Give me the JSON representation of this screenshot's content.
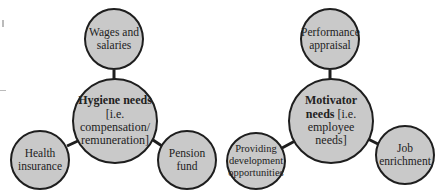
{
  "diagrams": [
    {
      "name": "hygiene",
      "hub": {
        "title": "Hygiene needs",
        "subtitle": "[i.e. compensation/ remuneration]"
      },
      "satellites": [
        {
          "label": "Wages and salaries"
        },
        {
          "label": "Health insurance"
        },
        {
          "label": "Pension fund"
        }
      ]
    },
    {
      "name": "motivator",
      "hub": {
        "title": "Motivator needs",
        "subtitle": "[i.e. employee needs]"
      },
      "satellites": [
        {
          "label": "Performance appraisal"
        },
        {
          "label": "Providing development opportunities"
        },
        {
          "label": "Job enrichment"
        }
      ]
    }
  ],
  "colors": {
    "node_fill": "#c9c9c9",
    "stroke": "#1e1e1e"
  }
}
